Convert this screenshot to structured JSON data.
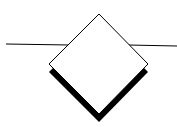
{
  "diagram": {
    "type": "decision-diamond",
    "colors": {
      "stroke": "#000000",
      "fill": "#ffffff",
      "shadow": "#000000"
    },
    "label": ""
  }
}
